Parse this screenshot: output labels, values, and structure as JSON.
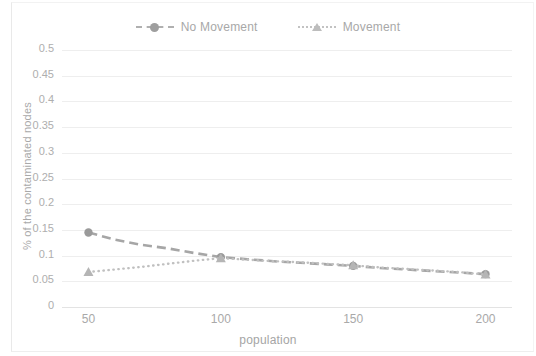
{
  "chart_data": {
    "type": "line",
    "title": "",
    "xlabel": "population",
    "ylabel": "% of the contaminated nodes",
    "xlim": [
      40,
      210
    ],
    "ylim": [
      0,
      0.5
    ],
    "grid": true,
    "legend_position": "top-center",
    "x_ticks": [
      "50",
      "100",
      "150",
      "200"
    ],
    "x_tick_values": [
      50,
      100,
      150,
      200
    ],
    "y_ticks": [
      "0",
      "0.05",
      "0.1",
      "0.15",
      "0.2",
      "0.25",
      "0.3",
      "0.35",
      "0.4",
      "0.45",
      "0.5"
    ],
    "y_tick_values": [
      0,
      0.05,
      0.1,
      0.15,
      0.2,
      0.25,
      0.3,
      0.35,
      0.4,
      0.45,
      0.5
    ],
    "x": [
      50,
      60,
      70,
      80,
      90,
      100,
      110,
      120,
      130,
      140,
      150,
      160,
      170,
      180,
      190,
      200
    ],
    "series": [
      {
        "name": "No Movement",
        "color": "#a6a6a6",
        "linestyle": "dashed",
        "marker": "circle",
        "values": [
          0.145,
          0.131,
          0.121,
          0.114,
          0.105,
          0.097,
          0.093,
          0.089,
          0.086,
          0.083,
          0.08,
          0.076,
          0.073,
          0.07,
          0.067,
          0.064
        ]
      },
      {
        "name": "Movement",
        "color": "#c0c0c0",
        "linestyle": "dotted",
        "marker": "triangle",
        "values": [
          0.068,
          0.073,
          0.078,
          0.084,
          0.09,
          0.095,
          0.092,
          0.089,
          0.087,
          0.084,
          0.081,
          0.077,
          0.074,
          0.071,
          0.068,
          0.063
        ]
      }
    ]
  },
  "legend": {
    "entries": [
      {
        "label": "No Movement"
      },
      {
        "label": "Movement"
      }
    ]
  },
  "axes": {
    "x_title": "population",
    "y_title": "% of the contaminated nodes"
  }
}
